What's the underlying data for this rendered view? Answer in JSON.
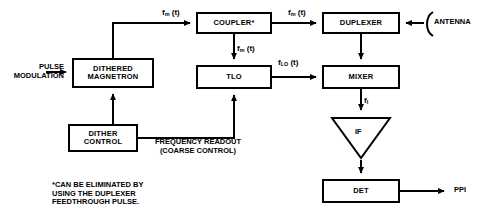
{
  "diagram": {
    "stroke_color": "#000000",
    "background_color": "#ffffff"
  },
  "blocks": {
    "coupler": {
      "label": "COUPLER*",
      "x": 196,
      "y": 12,
      "w": 76,
      "h": 22,
      "font_size": 7.5
    },
    "duplexer": {
      "label": "DUPLEXER",
      "x": 322,
      "y": 12,
      "w": 78,
      "h": 22,
      "font_size": 7.5
    },
    "tlo": {
      "label": "TLO",
      "x": 196,
      "y": 65,
      "w": 76,
      "h": 24,
      "font_size": 7.5
    },
    "mixer": {
      "label": "MIXER",
      "x": 322,
      "y": 65,
      "w": 78,
      "h": 24,
      "font_size": 7.5
    },
    "dithered_magnetron": {
      "label": "DITHERED\nMAGNETRON",
      "x": 72,
      "y": 58,
      "w": 82,
      "h": 30,
      "font_size": 7.5
    },
    "dither_control": {
      "label": "DITHER\nCONTROL",
      "x": 68,
      "y": 124,
      "w": 70,
      "h": 28,
      "font_size": 7.5
    },
    "det": {
      "label": "DET",
      "x": 322,
      "y": 179,
      "w": 78,
      "h": 24,
      "font_size": 7.5
    }
  },
  "if_amplifier": {
    "label": "IF",
    "x": 330,
    "y": 116,
    "w": 62,
    "h": 44,
    "font_size": 7.5
  },
  "signals": {
    "fm_coupler_in": {
      "base": "f",
      "sub": "m",
      "suffix": " (t)",
      "x": 162,
      "y": 8,
      "font_size": 8
    },
    "fm_coupler_out": {
      "base": "f",
      "sub": "m",
      "suffix": " (t)",
      "x": 288,
      "y": 8,
      "font_size": 8
    },
    "fm_to_tlo": {
      "base": "f",
      "sub": "m",
      "suffix": " (t)",
      "x": 237,
      "y": 44,
      "font_size": 8
    },
    "flo_to_mixer": {
      "base": "f",
      "sub": "LO",
      "suffix": " (t)",
      "x": 278,
      "y": 58,
      "font_size": 8
    },
    "fi_to_if": {
      "base": "f",
      "sub": "I",
      "suffix": "",
      "x": 364,
      "y": 96,
      "font_size": 8
    }
  },
  "annotations": {
    "pulse_modulation": {
      "text": "PULSE\nMODULATION",
      "x": 4,
      "y": 63,
      "font_size": 7.5,
      "align": "right",
      "width": 60
    },
    "antenna": {
      "text": "ANTENNA",
      "x": 434,
      "y": 18,
      "font_size": 7.5
    },
    "ppi": {
      "text": "PPI",
      "x": 454,
      "y": 186,
      "font_size": 7.5
    },
    "frequency_readout": {
      "text": "FREQUENCY READOUT\n(COARSE CONTROL)",
      "x": 142,
      "y": 138,
      "font_size": 7.5,
      "align": "center",
      "width": 112
    },
    "footnote": {
      "text": "*CAN BE ELIMINATED BY\n  USING THE DUPLEXER\n  FEEDTHROUGH PULSE.",
      "x": 52,
      "y": 181,
      "font_size": 7.5
    }
  },
  "icons": {
    "antenna_symbol": "antenna-bracket-icon",
    "if_amplifier_symbol": "triangle-amplifier-icon"
  }
}
